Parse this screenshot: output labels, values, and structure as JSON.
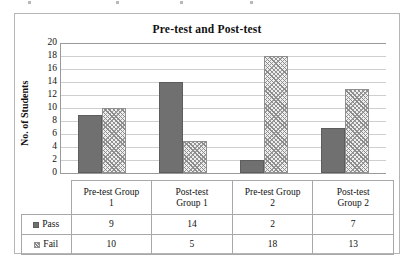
{
  "chart_data": {
    "type": "bar",
    "title": "Pre-test and Post-test",
    "xlabel": "",
    "ylabel": "No. of Students",
    "ylim": [
      0,
      20
    ],
    "ytick_step": 2,
    "yticks": [
      20,
      18,
      16,
      14,
      12,
      10,
      8,
      6,
      4,
      2,
      0
    ],
    "grid": "horizontal",
    "legend_position": "table-row-header",
    "categories": [
      "Pre-test Group 1",
      "Post-test Group 1",
      "Pre-test Group 2",
      "Post-test Group 2"
    ],
    "category_lines": [
      [
        "Pre-test Group",
        "1"
      ],
      [
        "Post-test",
        "Group 1"
      ],
      [
        "Pre-test Group",
        "2"
      ],
      [
        "Post-test",
        "Group 2"
      ]
    ],
    "series": [
      {
        "name": "Pass",
        "values": [
          9,
          14,
          2,
          7
        ],
        "fill": "solid",
        "color": "#707070"
      },
      {
        "name": "Fail",
        "values": [
          10,
          5,
          18,
          13
        ],
        "fill": "hatched",
        "color": "#8f8f8f"
      }
    ]
  },
  "table": {
    "rows": [
      {
        "label": "Pass",
        "marker": "solid-square-icon",
        "values": [
          "9",
          "14",
          "2",
          "7"
        ]
      },
      {
        "label": "Fail",
        "marker": "hatched-square-icon",
        "values": [
          "10",
          "5",
          "18",
          "13"
        ]
      }
    ]
  },
  "colors": {
    "pass_fill": "#707070",
    "fail_fill": "#8f8f8f",
    "gridline": "#cfcfcf",
    "axis": "#9a9a9a",
    "frame": "#b5b5b5",
    "text": "#111111"
  }
}
